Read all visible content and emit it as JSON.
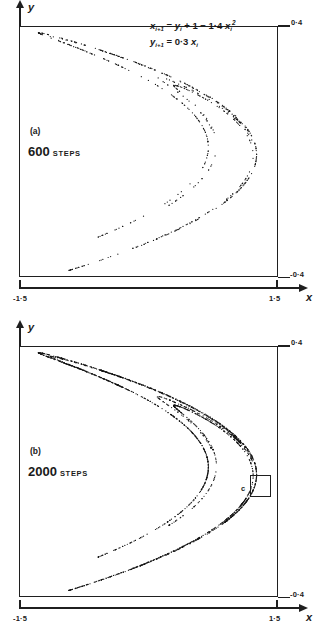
{
  "figure": {
    "equations": {
      "line1_prefix": "x",
      "line1": "x(i+1) = y(i) + 1 - 1.4 x(i)^2",
      "line2": "y(i+1) = 0.3 x(i)",
      "a_param": "1.4",
      "b_param": "0.3",
      "constant": "1"
    },
    "axis": {
      "x_label": "x",
      "y_label": "y",
      "x_min_label": "-1·5",
      "x_max_label": "1·5",
      "y_max_label": "0·4",
      "y_min_label": "-0·4"
    },
    "colors": {
      "ink": "#1f1f1f",
      "point": "#151515",
      "background": "#ffffff"
    }
  },
  "panels": [
    {
      "id": "a",
      "tag": "(a)",
      "steps_count": "600",
      "steps_unit": "STEPS",
      "has_equations": true,
      "has_magnification_box": false
    },
    {
      "id": "b",
      "tag": "(b)",
      "steps_count": "2000",
      "steps_unit": "STEPS",
      "has_equations": false,
      "has_magnification_box": true,
      "magnification_label": "c"
    }
  ],
  "chart_data": {
    "type": "scatter",
    "title": "",
    "xlabel": "x",
    "ylabel": "y",
    "xlim": [
      -1.5,
      1.5
    ],
    "ylim": [
      -0.4,
      0.4
    ],
    "grid": false,
    "legend_position": "none",
    "map": "henon",
    "map_parameters": {
      "a": 1.4,
      "b": 0.3
    },
    "series": [
      {
        "name": "600 steps",
        "panel": "a",
        "n_points": 600
      },
      {
        "name": "2000 steps",
        "panel": "b",
        "n_points": 2000
      }
    ],
    "annotations": [
      {
        "panel": "a",
        "text": "(a)",
        "x": -1.22,
        "y": -0.005
      },
      {
        "panel": "a",
        "text": "600 STEPS",
        "x": -1.24,
        "y": -0.06
      },
      {
        "panel": "a",
        "text": "x(i+1) = y(i) + 1 - 1.4 x(i)^2",
        "x": 0.28,
        "y": 0.33
      },
      {
        "panel": "a",
        "text": "y(i+1) = 0.3 x(i)",
        "x": 0.28,
        "y": 0.29
      },
      {
        "panel": "b",
        "text": "(b)",
        "x": -1.22,
        "y": -0.005
      },
      {
        "panel": "b",
        "text": "2000 STEPS",
        "x": -1.24,
        "y": -0.06
      },
      {
        "panel": "b",
        "text": "c",
        "x": 1.19,
        "y": -0.055,
        "kind": "magnification-box-label"
      }
    ]
  }
}
